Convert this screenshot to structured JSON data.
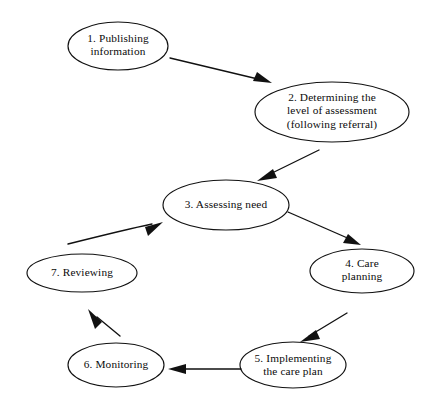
{
  "diagram": {
    "type": "cycle-flowchart",
    "background_color": "#ffffff",
    "stroke_color": "#111111",
    "text_color": "#0b0b0b",
    "canvas": {
      "width": 435,
      "height": 412
    },
    "nodes": [
      {
        "id": "node-1",
        "number": "1.",
        "label": "1.  Publishing\ninformation",
        "lines": [
          "1.  Publishing",
          "information"
        ],
        "shape": "ellipse",
        "cx": 118,
        "cy": 46,
        "rx": 50,
        "ry": 24
      },
      {
        "id": "node-2",
        "number": "2.",
        "label": "2. Determining the\nlevel of assessment\n(following referral)",
        "lines": [
          "2. Determining the",
          "level of assessment",
          "(following referral)"
        ],
        "shape": "ellipse",
        "cx": 332,
        "cy": 112,
        "rx": 77,
        "ry": 30
      },
      {
        "id": "node-3",
        "number": "3.",
        "label": "3.  Assessing need",
        "lines": [
          "3.  Assessing need"
        ],
        "shape": "ellipse",
        "cx": 226,
        "cy": 205,
        "rx": 63,
        "ry": 25
      },
      {
        "id": "node-4",
        "number": "4.",
        "label": "4. Care\nplanning",
        "lines": [
          "4. Care",
          "planning"
        ],
        "shape": "ellipse",
        "cx": 362,
        "cy": 271,
        "rx": 52,
        "ry": 22
      },
      {
        "id": "node-5",
        "number": "5.",
        "label": "5.  Implementing\nthe care plan",
        "lines": [
          "5.  Implementing",
          "the care plan"
        ],
        "shape": "ellipse",
        "cx": 293,
        "cy": 365,
        "rx": 53,
        "ry": 23
      },
      {
        "id": "node-6",
        "number": "6.",
        "label": "6.  Monitoring",
        "lines": [
          "6.  Monitoring"
        ],
        "shape": "ellipse",
        "cx": 116,
        "cy": 365,
        "rx": 48,
        "ry": 22
      },
      {
        "id": "node-7",
        "number": "7.",
        "label": "7.  Reviewing",
        "lines": [
          "7.  Reviewing"
        ],
        "shape": "ellipse",
        "cx": 82,
        "cy": 273,
        "rx": 55,
        "ry": 19
      }
    ],
    "edges": [
      {
        "id": "edge-1-2",
        "from": "node-1",
        "to": "node-2",
        "direction": "down-right"
      },
      {
        "id": "edge-2-3",
        "from": "node-2",
        "to": "node-3",
        "direction": "down-left"
      },
      {
        "id": "edge-3-4",
        "from": "node-3",
        "to": "node-4",
        "direction": "down-right"
      },
      {
        "id": "edge-4-5",
        "from": "node-4",
        "to": "node-5",
        "direction": "down-left"
      },
      {
        "id": "edge-5-6",
        "from": "node-5",
        "to": "node-6",
        "direction": "left"
      },
      {
        "id": "edge-6-7",
        "from": "node-6",
        "to": "node-7",
        "direction": "up-left"
      },
      {
        "id": "edge-7-3",
        "from": "node-7",
        "to": "node-3",
        "direction": "up-right"
      }
    ]
  }
}
